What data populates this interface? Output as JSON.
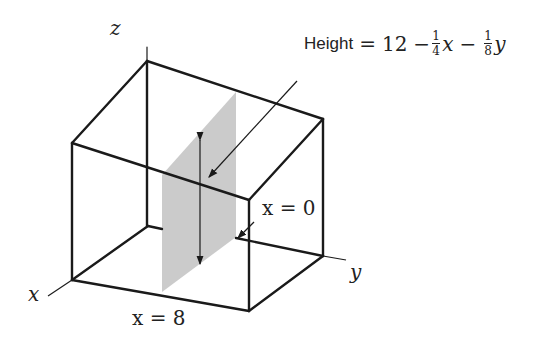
{
  "diagram": {
    "type": "3d-box-cross-section",
    "axes": {
      "x_label": "x",
      "y_label": "y",
      "z_label": "z"
    },
    "annotations": {
      "height_formula": {
        "word": "Height",
        "equals": "=",
        "constant": "12",
        "minus1": "−",
        "frac1_num": "1",
        "frac1_den": "4",
        "var1": "x",
        "minus2": "−",
        "frac2_num": "1",
        "frac2_den": "8",
        "var2": "y"
      },
      "x_zero_label": "x = 0",
      "x_eight_label": "x = 8"
    },
    "colors": {
      "lines": "#1a1a1a",
      "slab": "#c8c8c8"
    }
  }
}
